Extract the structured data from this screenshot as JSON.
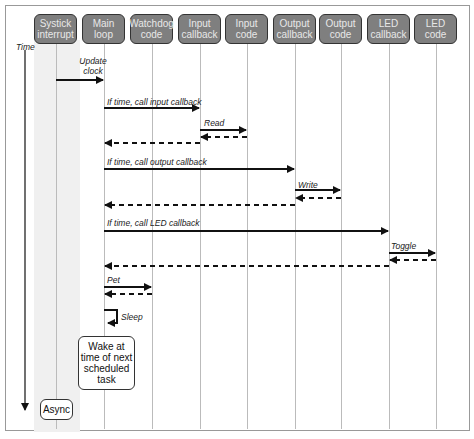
{
  "lanes": [
    {
      "label": "Systick interrupt",
      "x": 56
    },
    {
      "label": "Main loop",
      "x": 104
    },
    {
      "label": "Watchdog code",
      "x": 152
    },
    {
      "label": "Input callback",
      "x": 200
    },
    {
      "label": "Input code",
      "x": 247
    },
    {
      "label": "Output callback",
      "x": 295
    },
    {
      "label": "Output code",
      "x": 341
    },
    {
      "label": "LED callback",
      "x": 389
    },
    {
      "label": "LED code",
      "x": 436
    }
  ],
  "time_label": "Time",
  "messages": [
    {
      "label": "Update clock",
      "from": 56,
      "to": 104,
      "y": 80,
      "type": "call"
    },
    {
      "label": "If time, call input callback",
      "from": 104,
      "to": 200,
      "y": 108,
      "type": "call"
    },
    {
      "label": "Read",
      "from": 200,
      "to": 247,
      "y": 130,
      "type": "call"
    },
    {
      "label": "",
      "from": 247,
      "to": 200,
      "y": 137,
      "type": "return"
    },
    {
      "label": "",
      "from": 200,
      "to": 104,
      "y": 143,
      "type": "return"
    },
    {
      "label": "If time, call output callback",
      "from": 104,
      "to": 295,
      "y": 169,
      "type": "call"
    },
    {
      "label": "Write",
      "from": 295,
      "to": 341,
      "y": 190,
      "type": "call"
    },
    {
      "label": "",
      "from": 341,
      "to": 295,
      "y": 198,
      "type": "return"
    },
    {
      "label": "",
      "from": 295,
      "to": 104,
      "y": 205,
      "type": "return"
    },
    {
      "label": "If time, call LED callback",
      "from": 104,
      "to": 389,
      "y": 231,
      "type": "call"
    },
    {
      "label": "Toggle",
      "from": 389,
      "to": 436,
      "y": 253,
      "type": "call"
    },
    {
      "label": "",
      "from": 436,
      "to": 389,
      "y": 260,
      "type": "return"
    },
    {
      "label": "",
      "from": 389,
      "to": 104,
      "y": 266,
      "type": "return"
    },
    {
      "label": "Pet",
      "from": 104,
      "to": 152,
      "y": 287,
      "type": "call"
    },
    {
      "label": "",
      "from": 152,
      "to": 104,
      "y": 294,
      "type": "return"
    }
  ],
  "sleep_label": "Sleep",
  "wake_note": "Wake at time of next scheduled task",
  "async_label": "Async"
}
